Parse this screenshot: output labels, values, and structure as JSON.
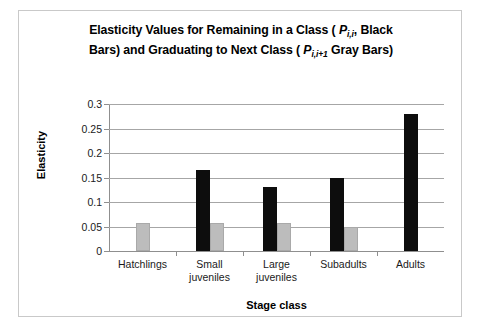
{
  "chart_data": {
    "type": "bar",
    "title_line1_pre": "Elasticity Values for Remaining in a Class ( ",
    "title_line1_sym": "P",
    "title_line1_sub": "i,i",
    "title_line1_post": ", Black",
    "title_line2_pre": "Bars) and Graduating to Next Class ( ",
    "title_line2_sym": "P",
    "title_line2_sub": "i,i+1",
    "title_line2_post": " Gray Bars)",
    "xlabel": "Stage class",
    "ylabel": "Elasticity",
    "categories": [
      "Hatchlings",
      "Small juveniles",
      "Large juveniles",
      "Subadults",
      "Adults"
    ],
    "category_lines": [
      [
        "Hatchlings"
      ],
      [
        "Small",
        "juveniles"
      ],
      [
        "Large",
        "juveniles"
      ],
      [
        "Subadults"
      ],
      [
        "Adults"
      ]
    ],
    "ylim": [
      0,
      0.3
    ],
    "yticks": [
      0,
      0.05,
      0.1,
      0.15,
      0.2,
      0.25,
      0.3
    ],
    "ytick_labels": [
      "0",
      "0.05",
      "0.1",
      "0.15",
      "0.2",
      "0.25",
      "0.3"
    ],
    "grid": true,
    "legend": "none",
    "series": [
      {
        "name": "Remaining in a Class (P i,i, Black Bars)",
        "color": "#0d0d0d",
        "values": [
          null,
          0.165,
          0.131,
          0.149,
          0.279
        ]
      },
      {
        "name": "Graduating to Next Class (P i,i+1 Gray Bars)",
        "color": "#bcbcbc",
        "values": [
          0.058,
          0.057,
          0.057,
          0.049,
          null
        ]
      }
    ]
  }
}
